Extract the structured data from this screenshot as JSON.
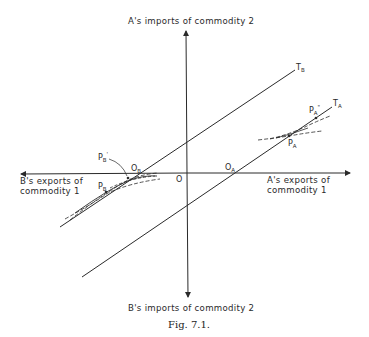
{
  "figure": {
    "caption": "Fig. 7.1.",
    "axes": {
      "top_label": "A's imports of commodity 2",
      "bottom_label": "B's imports of commodity 2",
      "left_label_line1": "B's exports of",
      "left_label_line2": "commodity 1",
      "right_label_line1": "A's exports of",
      "right_label_line2": "commodity 1",
      "origin_label": "O"
    },
    "lines": {
      "tb": {
        "label": "T",
        "sub": "B"
      },
      "ta": {
        "label": "T",
        "sub": "A"
      }
    },
    "points": {
      "ob": {
        "label": "O",
        "sub": "B"
      },
      "oa": {
        "label": "O",
        "sub": "A"
      },
      "pb": {
        "label": "P",
        "sub": "B"
      },
      "pb_prime": {
        "label": "P",
        "sub": "B",
        "sup": "'"
      },
      "pa": {
        "label": "P",
        "sub": "A"
      },
      "pa_dprime": {
        "label": "P",
        "sub": "A",
        "sup": "\""
      }
    },
    "colors": {
      "ink": "#2a2a2a",
      "background": "#ffffff"
    }
  }
}
